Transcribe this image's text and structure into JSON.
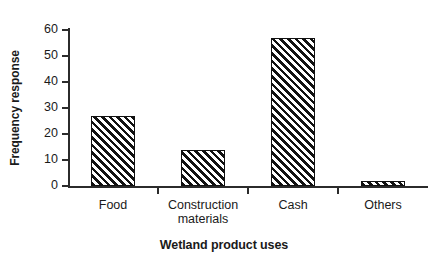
{
  "chart_data": {
    "type": "bar",
    "title": "",
    "xlabel": "Wetland product uses",
    "ylabel": "Frequency response",
    "categories": [
      "Food",
      "Construction\nmaterials",
      "Cash",
      "Others"
    ],
    "values": [
      27,
      14,
      57,
      2
    ],
    "ylim": [
      0,
      60
    ],
    "yticks": [
      0,
      10,
      20,
      30,
      40,
      50,
      60
    ],
    "ytick_labels": [
      "0",
      "10",
      "20",
      "30",
      "40",
      "50",
      "60"
    ],
    "grid": false,
    "legend": null,
    "bar_style": {
      "fill": "#ffffff",
      "hatch": "/",
      "hatch_color": "#111111",
      "edge_color": "#111111"
    },
    "axis_color": "#2b2b2b",
    "background": "#ffffff"
  }
}
